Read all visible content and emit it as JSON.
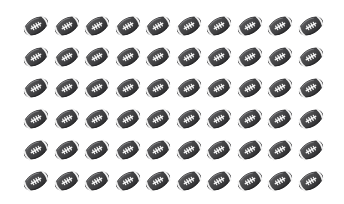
{
  "canvas": {
    "width": 344,
    "height": 204,
    "background_color": "#ffffff"
  },
  "grid": {
    "name": "american-football-emoji-grid",
    "columns": 10,
    "rows": 6,
    "total_icons": 60,
    "column_pitch_px": 30.5,
    "row_pitch_px": 31,
    "first_icon_center_x": 36,
    "first_icon_center_y": 26,
    "icon_width_px": 30,
    "icon_height_px": 30
  },
  "icon": {
    "semantic_name": "american-football-icon",
    "label": "American Football",
    "rotation_deg": -30,
    "ball_color_dark": "#3a3a3c",
    "ball_color_mid": "#4e4e50",
    "ball_color_light": "#6b6b6d",
    "ball_color_shadow": "#2a2a2c",
    "stripe_color": "#f2f2f2",
    "lace_color": "#ffffff",
    "outline_color": "#262628"
  },
  "repeated_labels": {
    "cell_name": "football-cell",
    "row_name": "football-row"
  }
}
